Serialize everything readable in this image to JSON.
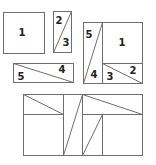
{
  "diagram": {
    "colors": {
      "stroke": "#6e6e6e",
      "label": "#222222",
      "background": "#ffffff"
    },
    "pieces": {
      "square": {
        "label": "1"
      },
      "tall_rect": {
        "upper_label": "2",
        "lower_label": "3"
      },
      "wide_rect": {
        "left_label": "5",
        "right_label": "4"
      }
    },
    "assembled_square": {
      "labels": {
        "p5": "5",
        "p1": "1",
        "p4": "4",
        "p3": "3",
        "p2": "2"
      }
    },
    "rearranged_rectangle": {
      "labels": []
    }
  }
}
